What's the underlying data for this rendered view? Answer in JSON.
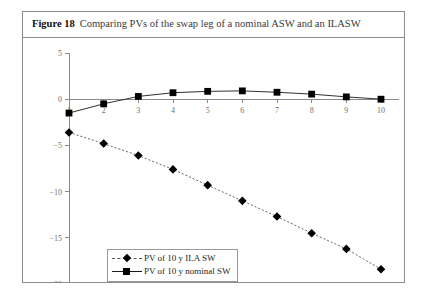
{
  "figure": {
    "label": "Figure 18",
    "title": "Comparing PVs of the swap leg of a nominal ASW and an ILASW"
  },
  "legend": {
    "items": [
      {
        "label": "PV of 10 y ILA SW",
        "marker": "diamond",
        "line": "dashed"
      },
      {
        "label": "PV of 10 y nominal SW",
        "marker": "square",
        "line": "solid"
      }
    ]
  },
  "chart_data": {
    "type": "line",
    "title": "Comparing PVs of the swap leg of a nominal ASW and an ILASW",
    "xlabel": "",
    "ylabel": "",
    "x": [
      1,
      2,
      3,
      4,
      5,
      6,
      7,
      8,
      9,
      10
    ],
    "categories": [
      "1",
      "2",
      "3",
      "4",
      "5",
      "6",
      "7",
      "8",
      "9",
      "10"
    ],
    "xlim": [
      1,
      10
    ],
    "ylim": [
      -20,
      5
    ],
    "yticks": [
      5,
      0,
      -5,
      -10,
      -15,
      -20
    ],
    "ytick_labels": [
      "5",
      "0",
      "−5",
      "−10",
      "−15",
      "−20"
    ],
    "xticks": [
      1,
      2,
      3,
      4,
      5,
      6,
      7,
      8,
      9,
      10
    ],
    "xtick_labels": [
      "1",
      "2",
      "3",
      "4",
      "5",
      "6",
      "7",
      "8",
      "9",
      "10"
    ],
    "grid": false,
    "legend_position": "bottom-left",
    "series": [
      {
        "name": "PV of 10 y ILA SW",
        "marker": "diamond",
        "line": "dashed",
        "values": [
          -3.6,
          -4.8,
          -6.1,
          -7.6,
          -9.3,
          -11.0,
          -12.7,
          -14.5,
          -16.2,
          -18.4
        ]
      },
      {
        "name": "PV of 10 y nominal SW",
        "marker": "square",
        "line": "solid",
        "values": [
          -1.5,
          -0.5,
          0.3,
          0.7,
          0.85,
          0.9,
          0.75,
          0.55,
          0.25,
          0.0
        ]
      }
    ]
  }
}
